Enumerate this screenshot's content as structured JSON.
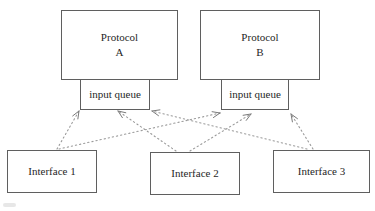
{
  "diagram": {
    "colors": {
      "background": "#ffffff",
      "box_border": "#5f5f5f",
      "text": "#1f1f1f",
      "arrow_dots": "#9a9a9a",
      "arrow_head": "#7a7a7a"
    },
    "protocol_a": {
      "name_line1": "Protocol",
      "name_line2": "A",
      "queue_label": "input queue"
    },
    "protocol_b": {
      "name_line1": "Protocol",
      "name_line2": "B",
      "queue_label": "input queue"
    },
    "interfaces": [
      {
        "label": "Interface 1"
      },
      {
        "label": "Interface 2"
      },
      {
        "label": "Interface 3"
      }
    ],
    "connections": [
      {
        "from": "interface-1",
        "to": "input-queue-a",
        "x1": 57,
        "y1": 149,
        "x2": 79,
        "y2": 111
      },
      {
        "from": "interface-1",
        "to": "input-queue-b",
        "x1": 59,
        "y1": 149,
        "x2": 220,
        "y2": 113
      },
      {
        "from": "interface-2",
        "to": "input-queue-a",
        "x1": 176,
        "y1": 151,
        "x2": 118,
        "y2": 111
      },
      {
        "from": "interface-2",
        "to": "input-queue-b",
        "x1": 190,
        "y1": 151,
        "x2": 251,
        "y2": 114
      },
      {
        "from": "interface-3",
        "to": "input-queue-a",
        "x1": 307,
        "y1": 149,
        "x2": 152,
        "y2": 111
      },
      {
        "from": "interface-3",
        "to": "input-queue-b",
        "x1": 313,
        "y1": 149,
        "x2": 291,
        "y2": 114
      }
    ],
    "arrow_style": {
      "dash": "1.3 2.9",
      "head_length": 8,
      "head_half_angle_deg": 22
    }
  }
}
